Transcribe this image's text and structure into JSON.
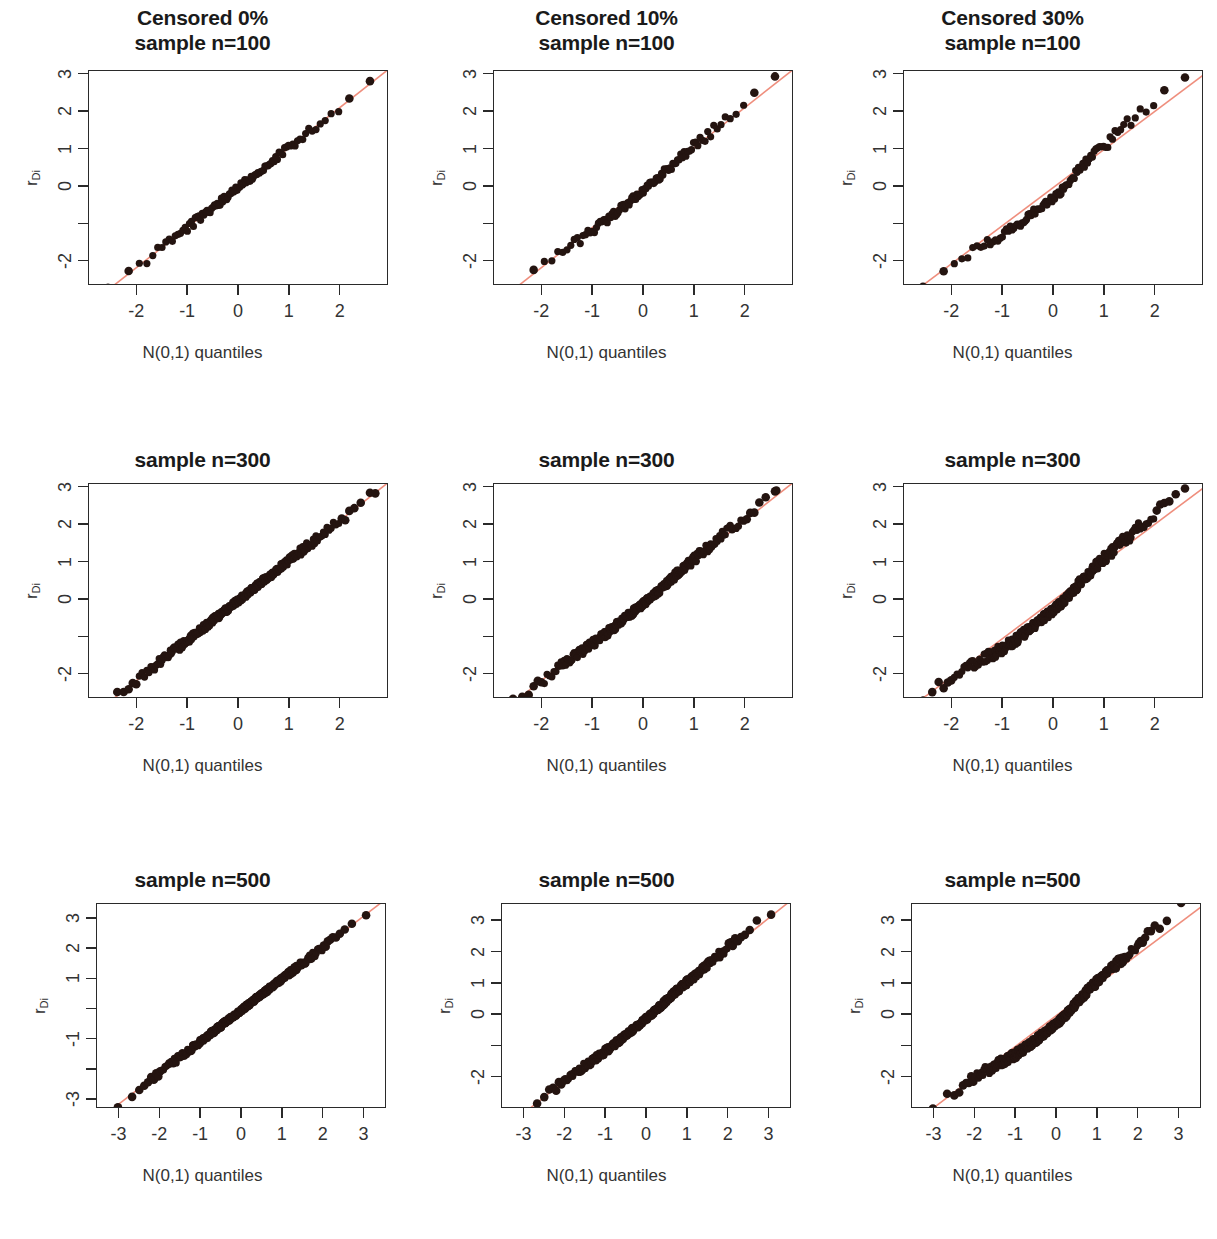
{
  "figure": {
    "kind": "qq-plot-grid",
    "rows": 3,
    "cols": 3,
    "point_color": "#241410",
    "line_color": "#ef8e7d",
    "frame_color": "#2a2a2a",
    "background": "#ffffff"
  },
  "panels": [
    {
      "id": "r1c1",
      "title": "Censored 0%\nsample n=100",
      "title_lines": 2,
      "xlabel": "N(0,1) quantiles",
      "ylabel_main": "r",
      "ylabel_sub": "Di",
      "chart_data": {
        "type": "scatter",
        "title": "Censored 0% sample n=100",
        "subtitle": "",
        "xlabel": "N(0,1) quantiles",
        "ylabel": "r_Di",
        "xlim": [
          -2.95,
          2.95
        ],
        "ylim": [
          -2.65,
          3.1
        ],
        "xticks": [
          -2,
          -1,
          0,
          1,
          2
        ],
        "xtick_labels": [
          "-2",
          "-1",
          "0",
          "1",
          "2"
        ],
        "yticks": [
          -2,
          -1,
          0,
          1,
          2,
          3
        ],
        "ytick_labels": [
          "-2",
          "",
          "0",
          "1",
          "2",
          "3"
        ],
        "grid": false,
        "legend": "none",
        "n": 100,
        "censoring_pct": 0,
        "reference_line": {
          "intercept": 0.0,
          "slope": 1.07,
          "color": "#ef8e7d"
        },
        "band": {
          "half_width": 0.12,
          "shape": "straight"
        },
        "x": [
          -2.58,
          -2.17,
          -1.96,
          -1.82,
          -1.7,
          -1.6,
          -1.51,
          -1.43,
          -1.36,
          -1.29,
          -1.22,
          -1.16,
          -1.1,
          -1.05,
          -0.99,
          -0.94,
          -0.89,
          -0.85,
          -0.8,
          -0.75,
          -0.71,
          -0.67,
          -0.62,
          -0.58,
          -0.54,
          -0.5,
          -0.46,
          -0.42,
          -0.38,
          -0.35,
          -0.31,
          -0.27,
          -0.23,
          -0.2,
          -0.16,
          -0.12,
          -0.09,
          -0.05,
          -0.01,
          0.02,
          0.06,
          0.09,
          0.13,
          0.17,
          0.2,
          0.24,
          0.28,
          0.31,
          0.35,
          0.39,
          0.43,
          0.47,
          0.51,
          0.55,
          0.59,
          0.63,
          0.68,
          0.72,
          0.77,
          0.82,
          0.87,
          0.92,
          0.97,
          1.03,
          1.09,
          1.15,
          1.22,
          1.3,
          1.38,
          1.47,
          1.58,
          1.7,
          1.85,
          2.05,
          2.17,
          2.58
        ],
        "y": [
          -2.3,
          -1.88,
          -1.72,
          -1.63,
          -1.55,
          -1.48,
          -1.42,
          -1.36,
          -1.3,
          -1.25,
          -1.19,
          -1.14,
          -1.09,
          -1.04,
          -0.99,
          -0.95,
          -0.9,
          -0.86,
          -0.82,
          -0.77,
          -0.73,
          -0.69,
          -0.65,
          -0.61,
          -0.57,
          -0.53,
          -0.49,
          -0.45,
          -0.41,
          -0.37,
          -0.33,
          -0.29,
          -0.25,
          -0.21,
          -0.17,
          -0.13,
          -0.09,
          -0.05,
          -0.01,
          0.03,
          0.07,
          0.11,
          0.15,
          0.19,
          0.23,
          0.27,
          0.31,
          0.35,
          0.39,
          0.43,
          0.48,
          0.52,
          0.57,
          0.61,
          0.66,
          0.71,
          0.76,
          0.81,
          0.87,
          0.92,
          0.98,
          1.04,
          1.1,
          1.17,
          1.24,
          1.32,
          1.4,
          1.49,
          1.59,
          1.7,
          1.83,
          1.98,
          2.16,
          2.42,
          2.46,
          2.83
        ]
      }
    },
    {
      "id": "r1c2",
      "title": "Censored 10%\nsample n=100",
      "title_lines": 2,
      "xlabel": "N(0,1) quantiles",
      "ylabel_main": "r",
      "ylabel_sub": "Di",
      "chart_data": {
        "type": "scatter",
        "title": "Censored 10% sample n=100",
        "xlabel": "N(0,1) quantiles",
        "ylabel": "r_Di",
        "xlim": [
          -2.95,
          2.95
        ],
        "ylim": [
          -2.65,
          3.1
        ],
        "xticks": [
          -2,
          -1,
          0,
          1,
          2
        ],
        "xtick_labels": [
          "-2",
          "-1",
          "0",
          "1",
          "2"
        ],
        "yticks": [
          -2,
          -1,
          0,
          1,
          2,
          3
        ],
        "ytick_labels": [
          "-2",
          "",
          "0",
          "1",
          "2",
          "3"
        ],
        "grid": false,
        "legend": "none",
        "n": 100,
        "censoring_pct": 10,
        "reference_line": {
          "intercept": 0.0,
          "slope": 1.07,
          "color": "#ef8e7d"
        },
        "band": {
          "half_width": 0.13,
          "shape": "slight-s"
        }
      }
    },
    {
      "id": "r1c3",
      "title": "Censored 30%\nsample n=100",
      "title_lines": 2,
      "xlabel": "N(0,1) quantiles",
      "ylabel_main": "r",
      "ylabel_sub": "Di",
      "chart_data": {
        "type": "scatter",
        "title": "Censored 30% sample n=100",
        "xlabel": "N(0,1) quantiles",
        "ylabel": "r_Di",
        "xlim": [
          -2.95,
          2.95
        ],
        "ylim": [
          -2.65,
          3.1
        ],
        "xticks": [
          -2,
          -1,
          0,
          1,
          2
        ],
        "xtick_labels": [
          "-2",
          "-1",
          "0",
          "1",
          "2"
        ],
        "yticks": [
          -2,
          -1,
          0,
          1,
          2,
          3
        ],
        "ytick_labels": [
          "-2",
          "",
          "0",
          "1",
          "2",
          "3"
        ],
        "grid": false,
        "legend": "none",
        "n": 100,
        "censoring_pct": 30,
        "reference_line": {
          "intercept": 0.0,
          "slope": 1.02,
          "color": "#ef8e7d"
        },
        "band": {
          "half_width": 0.16,
          "shape": "strong-s"
        }
      }
    },
    {
      "id": "r2c1",
      "title": "sample n=300",
      "title_lines": 1,
      "xlabel": "N(0,1) quantiles",
      "ylabel_main": "r",
      "ylabel_sub": "Di",
      "chart_data": {
        "type": "scatter",
        "title": "sample n=300",
        "xlabel": "N(0,1) quantiles",
        "ylabel": "r_Di",
        "xlim": [
          -2.95,
          2.95
        ],
        "ylim": [
          -2.65,
          3.1
        ],
        "xticks": [
          -2,
          -1,
          0,
          1,
          2
        ],
        "xtick_labels": [
          "-2",
          "-1",
          "0",
          "1",
          "2"
        ],
        "yticks": [
          -2,
          -1,
          0,
          1,
          2,
          3
        ],
        "ytick_labels": [
          "-2",
          "",
          "0",
          "1",
          "2",
          "3"
        ],
        "grid": false,
        "legend": "none",
        "n": 300,
        "censoring_pct": 0,
        "reference_line": {
          "intercept": 0.0,
          "slope": 1.07,
          "color": "#ef8e7d"
        },
        "band": {
          "half_width": 0.11,
          "shape": "straight"
        }
      }
    },
    {
      "id": "r2c2",
      "title": "sample n=300",
      "title_lines": 1,
      "xlabel": "N(0,1) quantiles",
      "ylabel_main": "r",
      "ylabel_sub": "Di",
      "chart_data": {
        "type": "scatter",
        "title": "sample n=300",
        "xlabel": "N(0,1) quantiles",
        "ylabel": "r_Di",
        "xlim": [
          -2.95,
          2.95
        ],
        "ylim": [
          -2.65,
          3.1
        ],
        "xticks": [
          -2,
          -1,
          0,
          1,
          2
        ],
        "xtick_labels": [
          "-2",
          "-1",
          "0",
          "1",
          "2"
        ],
        "yticks": [
          -2,
          -1,
          0,
          1,
          2,
          3
        ],
        "ytick_labels": [
          "-2",
          "",
          "0",
          "1",
          "2",
          "3"
        ],
        "grid": false,
        "legend": "none",
        "n": 300,
        "censoring_pct": 10,
        "reference_line": {
          "intercept": 0.0,
          "slope": 1.07,
          "color": "#ef8e7d"
        },
        "band": {
          "half_width": 0.13,
          "shape": "slight-s"
        }
      }
    },
    {
      "id": "r2c3",
      "title": "sample n=300",
      "title_lines": 1,
      "xlabel": "N(0,1) quantiles",
      "ylabel_main": "r",
      "ylabel_sub": "Di",
      "chart_data": {
        "type": "scatter",
        "title": "sample n=300",
        "xlabel": "N(0,1) quantiles",
        "ylabel": "r_Di",
        "xlim": [
          -2.95,
          2.95
        ],
        "ylim": [
          -2.65,
          3.1
        ],
        "xticks": [
          -2,
          -1,
          0,
          1,
          2
        ],
        "xtick_labels": [
          "-2",
          "-1",
          "0",
          "1",
          "2"
        ],
        "yticks": [
          -2,
          -1,
          0,
          1,
          2,
          3
        ],
        "ytick_labels": [
          "-2",
          "",
          "0",
          "1",
          "2",
          "3"
        ],
        "grid": false,
        "legend": "none",
        "n": 300,
        "censoring_pct": 30,
        "reference_line": {
          "intercept": 0.0,
          "slope": 1.02,
          "color": "#ef8e7d"
        },
        "band": {
          "half_width": 0.15,
          "shape": "strong-s"
        }
      }
    },
    {
      "id": "r3c1",
      "title": "sample n=500",
      "title_lines": 1,
      "xlabel": "N(0,1) quantiles",
      "ylabel_main": "r",
      "ylabel_sub": "Di",
      "chart_data": {
        "type": "scatter",
        "title": "sample n=500",
        "xlabel": "N(0,1) quantiles",
        "ylabel": "r_Di",
        "xlim": [
          -3.55,
          3.55
        ],
        "ylim": [
          -3.3,
          3.5
        ],
        "xticks": [
          -3,
          -2,
          -1,
          0,
          1,
          2,
          3
        ],
        "xtick_labels": [
          "-3",
          "-2",
          "-1",
          "0",
          "1",
          "2",
          "3"
        ],
        "yticks": [
          -3,
          -2,
          -1,
          0,
          1,
          2,
          3
        ],
        "ytick_labels": [
          "-3",
          "",
          "-1",
          "",
          "1",
          "2",
          "3"
        ],
        "grid": false,
        "legend": "none",
        "n": 500,
        "censoring_pct": 0,
        "reference_line": {
          "intercept": 0.0,
          "slope": 1.04,
          "color": "#ef8e7d"
        },
        "band": {
          "half_width": 0.1,
          "shape": "straight"
        }
      }
    },
    {
      "id": "r3c2",
      "title": "sample n=500",
      "title_lines": 1,
      "xlabel": "N(0,1) quantiles",
      "ylabel_main": "r",
      "ylabel_sub": "Di",
      "chart_data": {
        "type": "scatter",
        "title": "sample n=500",
        "xlabel": "N(0,1) quantiles",
        "ylabel": "r_Di",
        "xlim": [
          -3.55,
          3.55
        ],
        "ylim": [
          -3.0,
          3.55
        ],
        "xticks": [
          -3,
          -2,
          -1,
          0,
          1,
          2,
          3
        ],
        "xtick_labels": [
          "-3",
          "-2",
          "-1",
          "0",
          "1",
          "2",
          "3"
        ],
        "yticks": [
          -2,
          -1,
          0,
          1,
          2,
          3
        ],
        "ytick_labels": [
          "-2",
          "",
          "0",
          "1",
          "2",
          "3"
        ],
        "grid": false,
        "legend": "none",
        "n": 500,
        "censoring_pct": 10,
        "reference_line": {
          "intercept": 0.0,
          "slope": 1.04,
          "color": "#ef8e7d"
        },
        "band": {
          "half_width": 0.12,
          "shape": "slight-s"
        }
      }
    },
    {
      "id": "r3c3",
      "title": "sample n=500",
      "title_lines": 1,
      "xlabel": "N(0,1) quantiles",
      "ylabel_main": "r",
      "ylabel_sub": "Di",
      "chart_data": {
        "type": "scatter",
        "title": "sample n=500",
        "xlabel": "N(0,1) quantiles",
        "ylabel": "r_Di",
        "xlim": [
          -3.55,
          3.55
        ],
        "ylim": [
          -3.0,
          3.55
        ],
        "xticks": [
          -3,
          -2,
          -1,
          0,
          1,
          2,
          3
        ],
        "xtick_labels": [
          "-3",
          "-2",
          "-1",
          "0",
          "1",
          "2",
          "3"
        ],
        "yticks": [
          -2,
          -1,
          0,
          1,
          2,
          3
        ],
        "ytick_labels": [
          "-2",
          "",
          "0",
          "1",
          "2",
          "3"
        ],
        "grid": false,
        "legend": "none",
        "n": 500,
        "censoring_pct": 30,
        "reference_line": {
          "intercept": 0.0,
          "slope": 0.98,
          "color": "#ef8e7d"
        },
        "band": {
          "half_width": 0.15,
          "shape": "strong-s"
        }
      }
    }
  ]
}
